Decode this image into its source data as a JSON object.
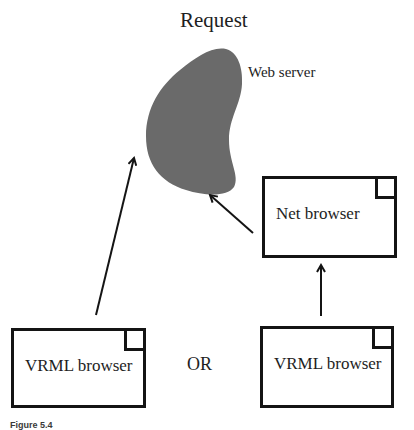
{
  "diagram": {
    "title": "Request",
    "server": {
      "label": "Web server",
      "fill_color": "#6a6a6a"
    },
    "nodes": [
      {
        "id": "net-browser",
        "label": "Net browser"
      },
      {
        "id": "vrml-browser-left",
        "label": "VRML browser"
      },
      {
        "id": "vrml-browser-right",
        "label": "VRML browser"
      }
    ],
    "connector_label": "OR",
    "edges": [
      {
        "from": "vrml-browser-left",
        "to": "web-server"
      },
      {
        "from": "net-browser",
        "to": "web-server"
      },
      {
        "from": "vrml-browser-right",
        "to": "net-browser"
      }
    ],
    "caption": "Figure 5.4",
    "colors": {
      "stroke": "#141414",
      "background": "#ffffff",
      "server_fill": "#6a6a6a"
    }
  }
}
